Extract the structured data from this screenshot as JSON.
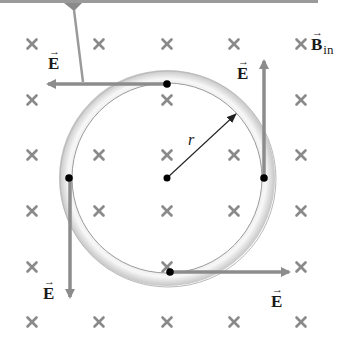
{
  "diagram": {
    "title": "",
    "colors": {
      "cross_marker": "#8a8a8a",
      "e_arrow": "#8c8c8c",
      "ring_outer": "#cfcfcf",
      "ring_highlight": "#f2f2f2",
      "ring_edge": "#9a9a9a",
      "dot": "#000000",
      "radius_line": "#222222",
      "top_bar": "#9a9a9a"
    },
    "magnetic_field": {
      "label": "B",
      "subscript": "in",
      "vector_symbol": "→",
      "marker": "×",
      "direction": "into page",
      "grid_columns_x": [
        32,
        99,
        167,
        234,
        301
      ],
      "grid_rows_y": [
        44,
        100,
        155,
        211,
        267,
        322
      ]
    },
    "ring": {
      "center": [
        167,
        178
      ],
      "inner_radius": 95,
      "outer_radius": 108
    },
    "radius_label": "r",
    "center_dot": [
      167,
      178
    ],
    "electric_field_vectors": [
      {
        "label": "E",
        "vector_symbol": "→",
        "position": "top",
        "direction": "left"
      },
      {
        "label": "E",
        "vector_symbol": "→",
        "position": "right",
        "direction": "up"
      },
      {
        "label": "E",
        "vector_symbol": "→",
        "position": "left",
        "direction": "down"
      },
      {
        "label": "E",
        "vector_symbol": "→",
        "position": "bottom",
        "direction": "right"
      }
    ]
  }
}
